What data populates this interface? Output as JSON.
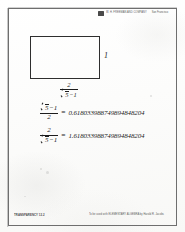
{
  "document": {
    "title": "Golden Ratio Transparency",
    "header": {
      "logo_icon": "publisher-logo-icon",
      "publisher": "W. H. FREEMAN AND COMPANY",
      "series": "San Francisco"
    },
    "figure": {
      "shape": "golden-rectangle",
      "height_label": "1",
      "width_label": {
        "numerator": "2",
        "denominator_radicand": "5",
        "denominator_suffix": "−1"
      }
    },
    "equations": [
      {
        "id": "phi-reciprocal",
        "numerator_radicand": "5",
        "numerator_suffix": "−1",
        "denominator": "2",
        "equals": "=",
        "value": "0.618033988749894848204"
      },
      {
        "id": "phi",
        "numerator": "2",
        "denominator_radicand": "5",
        "denominator_suffix": "−1",
        "equals": "=",
        "value": "1.618033988749894848204"
      }
    ],
    "footer": {
      "left": "TRANSPARENCY 12.2",
      "right": "To be used with ELEMENTARY ALGEBRA by Harold R. Jacobs"
    }
  }
}
